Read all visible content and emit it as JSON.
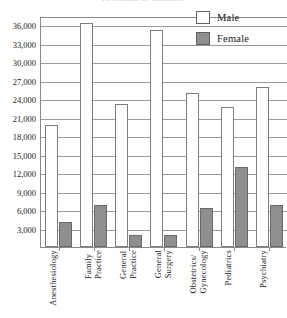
{
  "chart": {
    "cut_title": "Physicians by Specialty",
    "legend": [
      {
        "key": "male",
        "label": "Male",
        "color": "#ffffff"
      },
      {
        "key": "female",
        "label": "Female",
        "color": "#8f8f8f"
      }
    ]
  },
  "chart_data": {
    "type": "bar",
    "title": "",
    "xlabel": "",
    "ylabel": "",
    "ylim": [
      0,
      37500
    ],
    "grid": true,
    "legend_position": "top-right",
    "yticks": [
      3000,
      6000,
      9000,
      12000,
      15000,
      18000,
      21000,
      24000,
      27000,
      30000,
      33000,
      36000
    ],
    "ytick_labels": [
      "3,000",
      "6,000",
      "9,000",
      "12,000",
      "15,000",
      "18,000",
      "21,000",
      "24,000",
      "27,000",
      "30,000",
      "33,000",
      "36,000"
    ],
    "categories": [
      "Anesthesiology",
      "Family\nPractice",
      "General\nPractice",
      "General\nSurgery",
      "Obstetrics/\nGynecology",
      "Pediatrics",
      "Psychiatry"
    ],
    "series": [
      {
        "name": "Male",
        "values": [
          19800,
          36300,
          23200,
          35200,
          25000,
          22800,
          26000
        ]
      },
      {
        "name": "Female",
        "values": [
          4100,
          6900,
          2000,
          2000,
          6300,
          13000,
          6900
        ]
      }
    ]
  }
}
